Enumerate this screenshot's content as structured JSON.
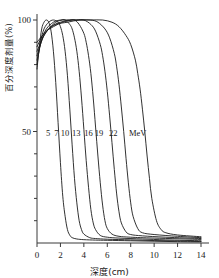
{
  "chart_data": {
    "type": "line",
    "title": "",
    "xlabel": "深度(cm)",
    "ylabel": "百分深度剂量(%)",
    "xlim": [
      0,
      14
    ],
    "ylim": [
      0,
      105
    ],
    "xticks": [
      "0",
      "2",
      "4",
      "6",
      "8",
      "10",
      "12",
      "14"
    ],
    "xtick_values": [
      0,
      2,
      4,
      6,
      8,
      10,
      12,
      14
    ],
    "yticks": [
      "50",
      "100"
    ],
    "ytick_values": [
      50,
      100
    ],
    "yminor_values": [
      10,
      20,
      30,
      40,
      60,
      70,
      80,
      90
    ],
    "grid": false,
    "legend_position": "inline-annotations",
    "legend_unit": "MeV",
    "series": [
      {
        "name": "5",
        "label": "5 MeV",
        "energy_mev": 5,
        "label_x": 0.95,
        "label_y": 48,
        "x": [
          0.0,
          0.2,
          0.4,
          0.6,
          0.8,
          1.0,
          1.2,
          1.4,
          1.6,
          1.8,
          2.0,
          2.2,
          2.4,
          2.6,
          2.8,
          3.0,
          3.4,
          4.0,
          5.0,
          6.0,
          8.0,
          10.0,
          12.0,
          14.0
        ],
        "y": [
          78,
          88,
          96,
          99,
          100,
          99,
          95,
          86,
          72,
          54,
          36,
          21,
          12,
          6,
          3.5,
          2.4,
          1.8,
          1.5,
          1.3,
          1.2,
          1.0,
          0.8,
          0.6,
          0.5
        ]
      },
      {
        "name": "7",
        "label": "7 MeV",
        "energy_mev": 7,
        "label_x": 1.65,
        "label_y": 48,
        "x": [
          0.0,
          0.3,
          0.6,
          1.0,
          1.4,
          1.8,
          2.0,
          2.2,
          2.4,
          2.6,
          2.8,
          3.0,
          3.2,
          3.4,
          3.6,
          3.8,
          4.0,
          4.5,
          5.0,
          6.0,
          8.0,
          10.0,
          12.0,
          14.0
        ],
        "y": [
          80,
          90,
          96,
          99,
          100,
          99,
          97,
          93,
          86,
          75,
          60,
          44,
          29,
          18,
          10,
          6,
          4,
          2.4,
          2.0,
          1.7,
          1.4,
          1.1,
          0.9,
          0.7
        ]
      },
      {
        "name": "10",
        "label": "10 MeV",
        "energy_mev": 10,
        "label_x": 2.4,
        "label_y": 48,
        "x": [
          0.0,
          0.4,
          0.8,
          1.4,
          2.0,
          2.4,
          2.8,
          3.0,
          3.2,
          3.4,
          3.6,
          3.8,
          4.0,
          4.2,
          4.4,
          4.6,
          4.8,
          5.0,
          5.4,
          6.0,
          7.0,
          9.0,
          11.0,
          14.0
        ],
        "y": [
          82,
          91,
          96,
          99,
          100,
          100,
          98,
          96,
          92,
          86,
          77,
          65,
          51,
          37,
          25,
          15,
          9,
          6,
          3.4,
          2.6,
          2.2,
          1.8,
          1.4,
          1.0
        ]
      },
      {
        "name": "13",
        "label": "13 MeV",
        "energy_mev": 13,
        "label_x": 3.35,
        "label_y": 48,
        "x": [
          0.0,
          0.5,
          1.0,
          1.6,
          2.2,
          2.8,
          3.2,
          3.6,
          4.0,
          4.2,
          4.4,
          4.6,
          4.8,
          5.0,
          5.2,
          5.4,
          5.6,
          5.8,
          6.0,
          6.4,
          7.0,
          8.0,
          10.0,
          14.0
        ],
        "y": [
          84,
          92,
          96,
          99,
          100,
          100,
          100,
          98,
          94,
          90,
          84,
          76,
          65,
          52,
          39,
          27,
          17,
          10,
          6.5,
          4.0,
          3.0,
          2.6,
          2.2,
          1.6
        ]
      },
      {
        "name": "16",
        "label": "16 MeV",
        "energy_mev": 16,
        "label_x": 4.4,
        "label_y": 48,
        "x": [
          0.0,
          0.6,
          1.2,
          2.0,
          2.8,
          3.4,
          4.0,
          4.6,
          5.0,
          5.4,
          5.6,
          5.8,
          6.0,
          6.2,
          6.4,
          6.6,
          6.8,
          7.0,
          7.2,
          7.6,
          8.0,
          9.0,
          11.0,
          14.0
        ],
        "y": [
          86,
          93,
          97,
          99,
          100,
          100,
          100,
          98,
          95,
          89,
          84,
          77,
          68,
          57,
          45,
          33,
          22,
          14,
          9,
          5.0,
          3.8,
          3.2,
          2.6,
          2.0
        ]
      },
      {
        "name": "19",
        "label": "19 MeV",
        "energy_mev": 19,
        "label_x": 5.3,
        "label_y": 48,
        "x": [
          0.0,
          0.6,
          1.4,
          2.2,
          3.0,
          3.8,
          4.6,
          5.2,
          5.8,
          6.2,
          6.6,
          6.8,
          7.0,
          7.2,
          7.4,
          7.6,
          7.8,
          8.0,
          8.2,
          8.6,
          9.0,
          10.0,
          12.0,
          14.0
        ],
        "y": [
          88,
          94,
          97,
          99,
          100,
          100,
          100,
          99,
          96,
          92,
          85,
          79,
          71,
          61,
          50,
          38,
          27,
          18,
          12,
          6.5,
          4.6,
          3.8,
          3.0,
          2.4
        ]
      },
      {
        "name": "22",
        "label": "22 MeV",
        "energy_mev": 22,
        "label_x": 6.5,
        "label_y": 48,
        "x": [
          0.0,
          0.8,
          1.6,
          2.6,
          3.6,
          4.6,
          5.6,
          6.4,
          7.0,
          7.6,
          8.0,
          8.4,
          8.6,
          8.8,
          9.0,
          9.2,
          9.4,
          9.6,
          9.8,
          10.2,
          10.6,
          11.0,
          12.0,
          14.0
        ],
        "y": [
          90,
          95,
          98,
          99,
          100,
          100,
          100,
          99,
          97,
          93,
          89,
          82,
          76,
          69,
          60,
          50,
          39,
          29,
          20,
          10,
          6.0,
          4.6,
          3.6,
          2.8
        ]
      }
    ],
    "annotations": [
      {
        "text": "MeV",
        "x": 8.6,
        "y": 48
      }
    ]
  },
  "axes": {
    "x_title": "深度(cm)",
    "y_title": "百分深度剂量(%)"
  }
}
